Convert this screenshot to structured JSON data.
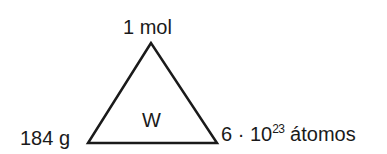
{
  "diagram": {
    "center_label": "W",
    "top_label": "1 mol",
    "left_label": "184 g",
    "right_label": {
      "prefix": "6 · 10",
      "exponent": "23",
      "suffix": " átomos"
    },
    "colors": {
      "stroke": "#1a1a1a",
      "background": "#ffffff"
    }
  }
}
